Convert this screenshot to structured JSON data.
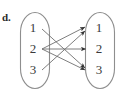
{
  "figure": {
    "part_label": "d.",
    "width": 117,
    "height": 99,
    "background_color": "#ffffff",
    "outline_color": "#8e8e8e",
    "edge_color": "#6f6f6f",
    "arrow_color": "#333333",
    "text_color": "#3a3a3a"
  },
  "diagram": {
    "type": "mapping-diagram",
    "domain": {
      "name": "left-set",
      "shape": "stadium",
      "elements": [
        {
          "label": "1",
          "x": 33,
          "y": 32
        },
        {
          "label": "2",
          "x": 33,
          "y": 53
        },
        {
          "label": "3",
          "x": 33,
          "y": 74
        }
      ]
    },
    "codomain": {
      "name": "right-set",
      "shape": "stadium",
      "elements": [
        {
          "label": "1",
          "x": 99,
          "y": 32
        },
        {
          "label": "2",
          "x": 99,
          "y": 53
        },
        {
          "label": "3",
          "x": 99,
          "y": 74
        }
      ]
    },
    "arrows": [
      {
        "from": "1",
        "to": "3",
        "x1": 42,
        "y1": 29,
        "x2": 85,
        "y2": 68
      },
      {
        "from": "2",
        "to": "1",
        "x1": 42,
        "y1": 49,
        "x2": 85,
        "y2": 27
      },
      {
        "from": "2",
        "to": "2",
        "x1": 42,
        "y1": 49,
        "x2": 86,
        "y2": 49
      },
      {
        "from": "2",
        "to": "3",
        "x1": 42,
        "y1": 49,
        "x2": 85,
        "y2": 70
      },
      {
        "from": "3",
        "to": "1",
        "x1": 42,
        "y1": 70,
        "x2": 85,
        "y2": 31
      }
    ]
  }
}
